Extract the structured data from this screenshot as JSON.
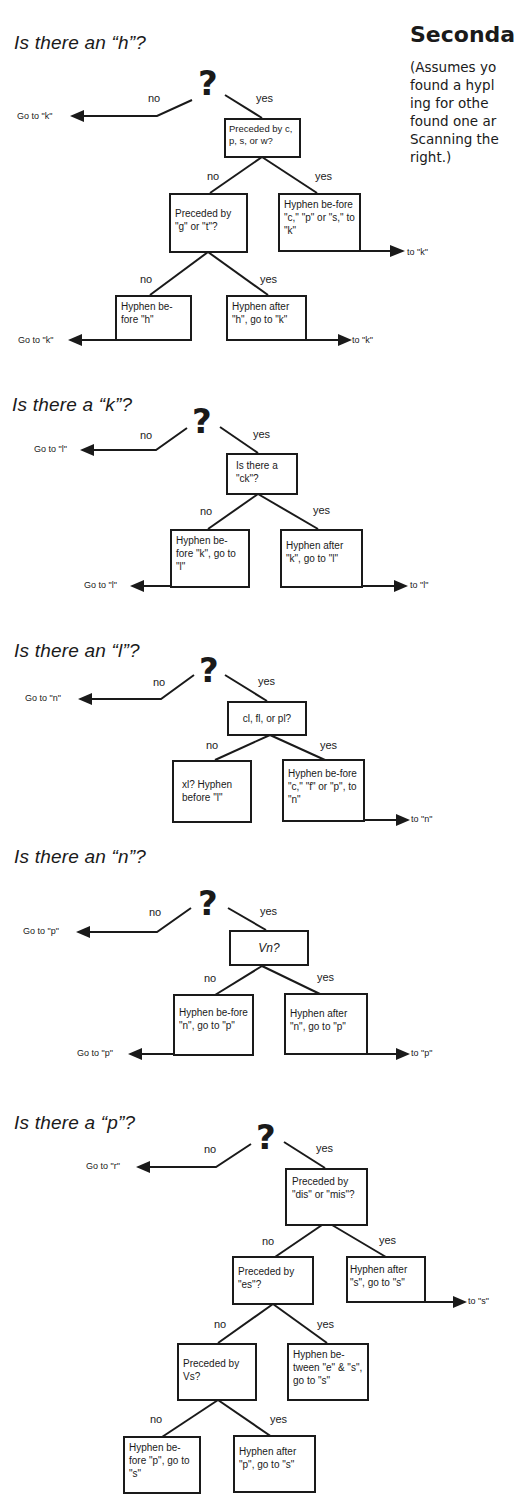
{
  "sidebar_text": {
    "title": "Seconda",
    "body_lines": [
      "(Assumes yo",
      "found a hypl",
      "ing for othe",
      "found one ar",
      "Scanning the",
      "right.)"
    ]
  },
  "common": {
    "question_mark": "?",
    "no": "no",
    "yes": "yes"
  },
  "trees": [
    {
      "heading": "Is there an “h”?",
      "no_goto": "Go to \"k\"",
      "q1": "Preceded by c, p, s, or w?",
      "q1_yes": "Hyphen be-fore \"c,\" \"p\" or \"s,\" to \"k\"",
      "q1_yes_goto": "to \"k\"",
      "q2": "Preceded by \"g\" or \"t\"?",
      "q2_no": "Hyphen be-fore \"h\"",
      "q2_no_goto": "Go to \"k\"",
      "q2_yes": "Hyphen after \"h\", go to \"k\"",
      "q2_yes_goto": "to \"k\""
    },
    {
      "heading": "Is there a “k”?",
      "no_goto": "Go to \"l\"",
      "q1": "Is there a \"ck\"?",
      "q1_no": "Hyphen be-fore \"k\", go to \"l\"",
      "q1_no_goto": "Go to \"l\"",
      "q1_yes": "Hyphen after \"k\", go to \"l\"",
      "q1_yes_goto": "to \"l\""
    },
    {
      "heading": "Is there an “l”?",
      "no_goto": "Go to \"n\"",
      "q1": "cl, fl, or pl?",
      "q1_no": "xl? Hyphen before \"l\"",
      "q1_yes": "Hyphen be-fore \"c,\" \"f\" or \"p\", to \"n\"",
      "q1_yes_goto": "to \"n\""
    },
    {
      "heading": "Is there an “n”?",
      "no_goto": "Go to \"p\"",
      "q1": "Vn?",
      "q1_no": "Hyphen be-fore \"n\", go to \"p\"",
      "q1_no_goto": "Go to \"p\"",
      "q1_yes": "Hyphen after \"n\", go to \"p\"",
      "q1_yes_goto": "to \"p\""
    },
    {
      "heading": "Is there a “p”?",
      "no_goto": "Go to \"r\"",
      "q1": "Preceded by \"dis\" or \"mis\"?",
      "q1_yes": "Hyphen after \"s\", go to \"s\"",
      "q1_yes_goto": "to \"s\"",
      "q2": "Preceded by \"es\"?",
      "q2_yes": "Hyphen be-tween \"e\" & \"s\", go to \"s\"",
      "q3": "Preceded by Vs?",
      "q3_no": "Hyphen be-fore \"p\", go to \"s\"",
      "q3_yes": "Hyphen after \"p\", go to \"s\""
    }
  ]
}
